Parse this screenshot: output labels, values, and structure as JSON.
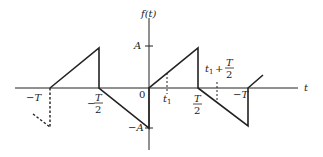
{
  "diagram": {
    "colors": {
      "stroke": "#222222",
      "background": "#ffffff"
    },
    "axes": {
      "x_label": "t",
      "y_label": "f(t)",
      "y_ticks": [
        {
          "label": "A",
          "value": "A"
        },
        {
          "label": "−A",
          "value": "-A"
        }
      ],
      "x_ticks": [
        {
          "label": "−T",
          "position": "-T"
        },
        {
          "label": "−T/2",
          "num": "T",
          "den": "2",
          "sign": "−"
        },
        {
          "label": "0"
        },
        {
          "label": "t₁",
          "base": "t",
          "sub": "1"
        },
        {
          "label": "T/2",
          "num": "T",
          "den": "2"
        },
        {
          "label": "t₁ + T/2",
          "base": "t",
          "sub": "1",
          "plus": "+",
          "num": "T",
          "den": "2"
        },
        {
          "label": "−T",
          "position": "T (right)"
        }
      ]
    },
    "labels": {
      "f_of_t": "f(t)",
      "t_axis": "t",
      "A": "A",
      "neg_A": "−A",
      "neg_T_left": "−T",
      "neg_T_half_sign": "−",
      "T_num": "T",
      "two_den": "2",
      "zero": "0",
      "t_base": "t",
      "one_sub": "1",
      "plus": "+",
      "neg_T_right": "−T"
    }
  }
}
